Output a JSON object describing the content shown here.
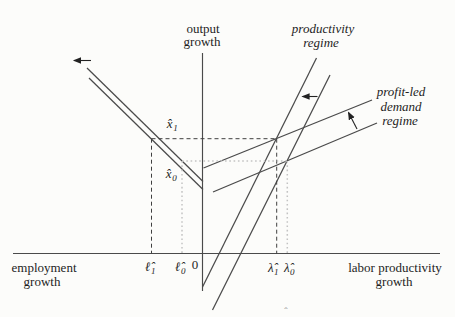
{
  "figure": {
    "type": "economics-growth-regimes-diagram",
    "axis_labels": {
      "vertical": [
        "output",
        "growth"
      ],
      "horizontal_left": [
        "employment",
        "growth"
      ],
      "horizontal_right": [
        "labor productivity",
        "growth"
      ],
      "origin": "0"
    },
    "curve_labels": {
      "productivity": [
        "productivity",
        "regime"
      ],
      "profit_led": [
        "profit-led",
        "demand",
        "regime"
      ]
    },
    "point_labels": {
      "x1": {
        "base": "x̂",
        "sub": "1"
      },
      "x0": {
        "base": "x̂",
        "sub": "0"
      },
      "l1": {
        "base": "ℓ̂",
        "sub": "1"
      },
      "l0": {
        "base": "ℓ̂",
        "sub": "0"
      },
      "lambda1": {
        "base": "λ̂",
        "sub": "1"
      },
      "lambda0": {
        "base": "λ̂",
        "sub": "0"
      }
    },
    "stray_mark": "ˆ",
    "colors": {
      "line": "#4a4a4a",
      "dash": "#3f3f3f",
      "dot": "#c3c3c3",
      "text": "#1e1e1e",
      "bg": "#fcfcfa"
    }
  }
}
